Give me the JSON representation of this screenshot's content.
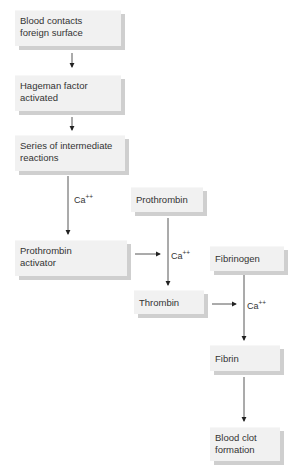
{
  "diagram": {
    "nodes": [
      {
        "id": "blood-contacts",
        "lines": [
          "Blood contacts",
          "foreign surface"
        ]
      },
      {
        "id": "hageman",
        "lines": [
          "Hageman factor",
          "activated"
        ]
      },
      {
        "id": "series",
        "lines": [
          "Series of intermediate",
          "reactions"
        ]
      },
      {
        "id": "prothrombin-activator",
        "lines": [
          "Prothrombin",
          "activator"
        ]
      },
      {
        "id": "prothrombin",
        "lines": [
          "Prothrombin"
        ]
      },
      {
        "id": "thrombin",
        "lines": [
          "Thrombin"
        ]
      },
      {
        "id": "fibrinogen",
        "lines": [
          "Fibrinogen"
        ]
      },
      {
        "id": "fibrin",
        "lines": [
          "Fibrin"
        ]
      },
      {
        "id": "blood-clot",
        "lines": [
          "Blood clot",
          "formation"
        ]
      }
    ],
    "cofactor": {
      "base": "Ca",
      "sup": "++"
    },
    "edges": [
      {
        "from": "blood-contacts",
        "to": "hageman"
      },
      {
        "from": "hageman",
        "to": "series"
      },
      {
        "from": "series",
        "to": "prothrombin-activator",
        "label": "Ca++"
      },
      {
        "from": "prothrombin-activator",
        "to": "prothrombin-thrombin",
        "label": "Ca++"
      },
      {
        "from": "prothrombin",
        "to": "thrombin"
      },
      {
        "from": "thrombin",
        "to": "fibrinogen-fibrin",
        "label": "Ca++"
      },
      {
        "from": "fibrinogen",
        "to": "fibrin"
      },
      {
        "from": "fibrin",
        "to": "blood-clot"
      }
    ]
  }
}
